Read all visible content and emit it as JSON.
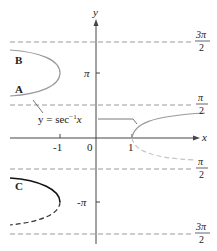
{
  "diagram": {
    "axes": {
      "x_label": "x",
      "y_label": "y",
      "x_ticks": [
        "-1",
        "0",
        "1"
      ],
      "y_ticks": [
        "π",
        "-π"
      ]
    },
    "asymptotes": [
      {
        "num": "3π",
        "den": "2"
      },
      {
        "num": "π",
        "den": "2"
      },
      {
        "num": "π",
        "den": "2"
      },
      {
        "num": "3π",
        "den": "2"
      }
    ],
    "curve_labels": [
      "B",
      "A",
      "C"
    ],
    "function_label": "y = sec",
    "function_sup": "−1",
    "function_var": "x",
    "colors": {
      "axis": "#444444",
      "curve_gray": "#9a9a9a",
      "curve_light": "#c4c4c4",
      "curve_black": "#111111",
      "dashed": "#9a9a9a"
    }
  }
}
